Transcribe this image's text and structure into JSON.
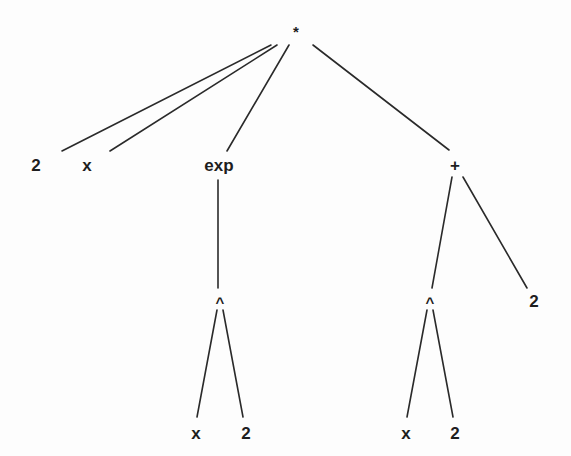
{
  "diagram": {
    "type": "expression-tree",
    "expression": "2 * x * exp(x^2) * (x^2 + 2)",
    "nodes": [
      {
        "id": "root",
        "label": "*",
        "x": 296,
        "y": 33
      },
      {
        "id": "n2a",
        "label": "2",
        "x": 36,
        "y": 167
      },
      {
        "id": "nx1",
        "label": "x",
        "x": 87,
        "y": 167
      },
      {
        "id": "nexp",
        "label": "exp",
        "x": 219,
        "y": 167
      },
      {
        "id": "nplus",
        "label": "+",
        "x": 455,
        "y": 167
      },
      {
        "id": "pow1",
        "label": "^",
        "x": 220,
        "y": 304
      },
      {
        "id": "pow2",
        "label": "^",
        "x": 430,
        "y": 304
      },
      {
        "id": "n2b",
        "label": "2",
        "x": 534,
        "y": 303
      },
      {
        "id": "nx2",
        "label": "x",
        "x": 196,
        "y": 435
      },
      {
        "id": "n2c",
        "label": "2",
        "x": 246,
        "y": 435
      },
      {
        "id": "nx3",
        "label": "x",
        "x": 406,
        "y": 435
      },
      {
        "id": "n2d",
        "label": "2",
        "x": 455,
        "y": 435
      }
    ],
    "edges": [
      {
        "from": "root",
        "to": "n2a",
        "x1": 271,
        "y1": 45,
        "x2": 62,
        "y2": 151
      },
      {
        "from": "root",
        "to": "nx1",
        "x1": 277,
        "y1": 45,
        "x2": 110,
        "y2": 151
      },
      {
        "from": "root",
        "to": "nexp",
        "x1": 289,
        "y1": 45,
        "x2": 227,
        "y2": 151
      },
      {
        "from": "root",
        "to": "nplus",
        "x1": 313,
        "y1": 45,
        "x2": 449,
        "y2": 150
      },
      {
        "from": "nexp",
        "to": "pow1",
        "x1": 218,
        "y1": 180,
        "x2": 218,
        "y2": 288
      },
      {
        "from": "nplus",
        "to": "pow2",
        "x1": 452,
        "y1": 177,
        "x2": 432,
        "y2": 288
      },
      {
        "from": "nplus",
        "to": "n2b",
        "x1": 463,
        "y1": 177,
        "x2": 527,
        "y2": 288
      },
      {
        "from": "pow1",
        "to": "nx2",
        "x1": 217,
        "y1": 310,
        "x2": 197,
        "y2": 417
      },
      {
        "from": "pow1",
        "to": "n2c",
        "x1": 223,
        "y1": 310,
        "x2": 243,
        "y2": 417
      },
      {
        "from": "pow2",
        "to": "nx3",
        "x1": 427,
        "y1": 310,
        "x2": 407,
        "y2": 417
      },
      {
        "from": "pow2",
        "to": "n2d",
        "x1": 433,
        "y1": 310,
        "x2": 453,
        "y2": 417
      }
    ]
  }
}
